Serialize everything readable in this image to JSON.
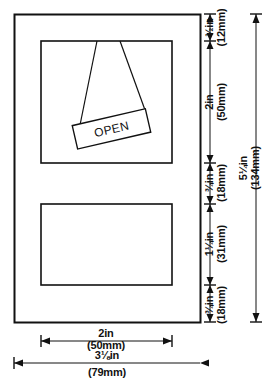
{
  "drawing": {
    "title": "Hinged sign window elevation",
    "sign_label": "OPEN",
    "line_color": "#111111",
    "background_color": "#ffffff"
  },
  "dimensions": {
    "vertical": [
      {
        "id": "top-rail",
        "inches": "½in",
        "mm": "(12mm)"
      },
      {
        "id": "upper-pane",
        "inches": "2in",
        "mm": "(50mm)"
      },
      {
        "id": "mid-rail-upper",
        "inches": "¾in",
        "mm": "(18mm)"
      },
      {
        "id": "lower-pane",
        "inches": "1¼in",
        "mm": "(31mm)"
      },
      {
        "id": "bottom-rail",
        "inches": "¾in",
        "mm": "(18mm)"
      }
    ],
    "overall_height": {
      "id": "overall-height",
      "inches": "5¼in",
      "mm": "(134mm)"
    },
    "horizontal": [
      {
        "id": "pane-width",
        "inches": "2in",
        "mm": "(50mm)"
      }
    ],
    "overall_width": {
      "id": "overall-width",
      "inches": "3⅛in",
      "mm": "(79mm)"
    }
  }
}
